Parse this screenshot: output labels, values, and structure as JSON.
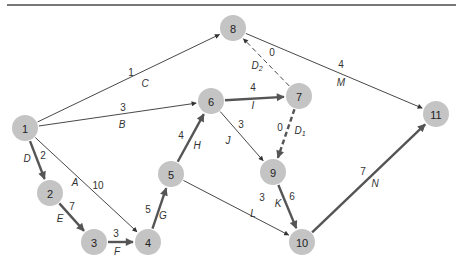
{
  "diagram": {
    "title": "",
    "colors": {
      "node_fill": "#c4c4c4",
      "thin_edge": "#333333",
      "critical_edge": "#555555",
      "rule": "#777777"
    },
    "nodes": [
      {
        "id": "1",
        "label": "1"
      },
      {
        "id": "2",
        "label": "2"
      },
      {
        "id": "3",
        "label": "3"
      },
      {
        "id": "4",
        "label": "4"
      },
      {
        "id": "5",
        "label": "5"
      },
      {
        "id": "6",
        "label": "6"
      },
      {
        "id": "7",
        "label": "7"
      },
      {
        "id": "8",
        "label": "8"
      },
      {
        "id": "9",
        "label": "9"
      },
      {
        "id": "10",
        "label": "10"
      },
      {
        "id": "11",
        "label": "11"
      }
    ],
    "edges": [
      {
        "from": "1",
        "to": "8",
        "activity": "C",
        "sub": "",
        "duration": "1",
        "critical": false,
        "dummy": false
      },
      {
        "from": "1",
        "to": "6",
        "activity": "B",
        "sub": "",
        "duration": "3",
        "critical": false,
        "dummy": false
      },
      {
        "from": "1",
        "to": "2",
        "activity": "D",
        "sub": "",
        "duration": "2",
        "critical": true,
        "dummy": false
      },
      {
        "from": "1",
        "to": "4",
        "activity": "A",
        "sub": "",
        "duration": "10",
        "critical": false,
        "dummy": false
      },
      {
        "from": "2",
        "to": "3",
        "activity": "E",
        "sub": "",
        "duration": "7",
        "critical": true,
        "dummy": false
      },
      {
        "from": "3",
        "to": "4",
        "activity": "F",
        "sub": "",
        "duration": "3",
        "critical": true,
        "dummy": false
      },
      {
        "from": "4",
        "to": "5",
        "activity": "G",
        "sub": "",
        "duration": "5",
        "critical": true,
        "dummy": false
      },
      {
        "from": "5",
        "to": "6",
        "activity": "H",
        "sub": "",
        "duration": "4",
        "critical": true,
        "dummy": false
      },
      {
        "from": "5",
        "to": "10",
        "activity": "L",
        "sub": "",
        "duration": "3",
        "critical": false,
        "dummy": false
      },
      {
        "from": "6",
        "to": "7",
        "activity": "I",
        "sub": "",
        "duration": "4",
        "critical": true,
        "dummy": false
      },
      {
        "from": "6",
        "to": "9",
        "activity": "J",
        "sub": "",
        "duration": "3",
        "critical": false,
        "dummy": false
      },
      {
        "from": "7",
        "to": "8",
        "activity": "D",
        "sub": "2",
        "duration": "0",
        "critical": false,
        "dummy": true
      },
      {
        "from": "7",
        "to": "9",
        "activity": "D",
        "sub": "1",
        "duration": "0",
        "critical": true,
        "dummy": true
      },
      {
        "from": "8",
        "to": "11",
        "activity": "M",
        "sub": "",
        "duration": "4",
        "critical": false,
        "dummy": false
      },
      {
        "from": "9",
        "to": "10",
        "activity": "K",
        "sub": "",
        "duration": "6",
        "critical": true,
        "dummy": false
      },
      {
        "from": "10",
        "to": "11",
        "activity": "N",
        "sub": "",
        "duration": "7",
        "critical": true,
        "dummy": false
      }
    ]
  }
}
